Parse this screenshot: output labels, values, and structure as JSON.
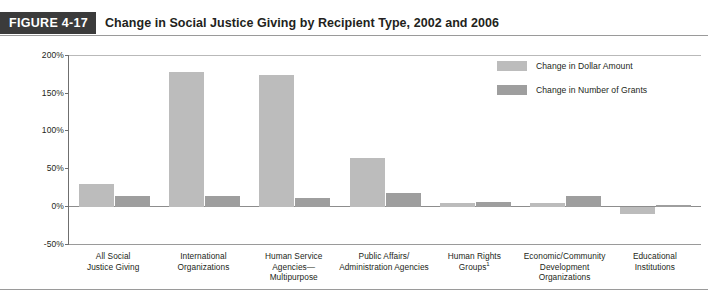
{
  "figure": {
    "tag": "FIGURE 4-17",
    "title": "Change in Social Justice Giving by Recipient Type, 2002 and 2006"
  },
  "colors": {
    "tag_background": "#3b3b3b",
    "series_dollar": "#bcbcbc",
    "series_grants": "#9e9e9e",
    "axis": "#6f6f6f",
    "text": "#231f20"
  },
  "legend": {
    "position": "top-right",
    "entries": [
      {
        "label": "Change in Dollar Amount",
        "color": "#bcbcbc"
      },
      {
        "label": "Change in Number of Grants",
        "color": "#9e9e9e"
      }
    ]
  },
  "chart_data": {
    "type": "bar",
    "title": "Change in Social Justice Giving by Recipient Type, 2002 and 2006",
    "xlabel": "",
    "ylabel": "",
    "ylim": [
      -50,
      200
    ],
    "yticks": [
      200,
      150,
      100,
      50,
      0,
      -50
    ],
    "ytick_labels": [
      "200%",
      "150%",
      "100%",
      "50%",
      "0%",
      "-50%"
    ],
    "grid": false,
    "categories": [
      "All Social\nJustice Giving",
      "International\nOrganizations",
      "Human Service\nAgencies—\nMultipurpose",
      "Public Affairs/\nAdministration Agencies",
      "Human Rights\nGroups1",
      "Economic/Community\nDevelopment\nOrganizations",
      "Educational\nInstitutions"
    ],
    "category_lines": [
      [
        "All Social",
        "Justice Giving"
      ],
      [
        "International",
        "Organizations"
      ],
      [
        "Human Service",
        "Agencies—",
        "Multipurpose"
      ],
      [
        "Public Affairs/",
        "Administration Agencies"
      ],
      [
        "Human Rights",
        "Groups"
      ],
      [
        "Economic/Community",
        "Development",
        "Organizations"
      ],
      [
        "Educational",
        "Institutions"
      ]
    ],
    "footnote_marker": "1",
    "footnote_marker_category": "Human Rights Groups",
    "series": [
      {
        "name": "Change in Dollar Amount",
        "color": "#bcbcbc",
        "values": [
          30,
          177,
          174,
          65,
          5,
          5,
          -9
        ]
      },
      {
        "name": "Change in Number of Grants",
        "color": "#9e9e9e",
        "values": [
          14,
          15,
          12,
          19,
          7,
          14,
          3
        ]
      }
    ]
  }
}
